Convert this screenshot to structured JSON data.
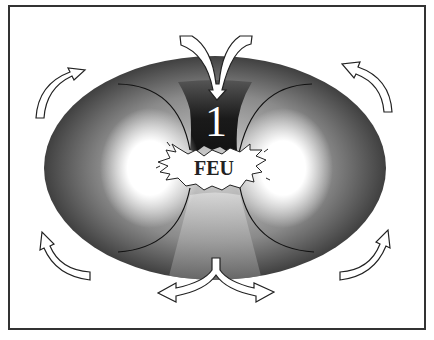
{
  "diagram": {
    "number_label": "1",
    "center_label": "FEU",
    "colors": {
      "frame": "#333333",
      "torus_dark": "#2a2a2a",
      "torus_light": "#ffffff",
      "arrow_fill": "#ffffff",
      "arrow_stroke": "#222222"
    },
    "arrows": [
      {
        "position": "top",
        "direction": "inward-down"
      },
      {
        "position": "bottom",
        "direction": "outward-split"
      },
      {
        "position": "top-left",
        "direction": "up-right"
      },
      {
        "position": "top-right",
        "direction": "up-left"
      },
      {
        "position": "bottom-left",
        "direction": "up"
      },
      {
        "position": "bottom-right",
        "direction": "up"
      }
    ]
  }
}
